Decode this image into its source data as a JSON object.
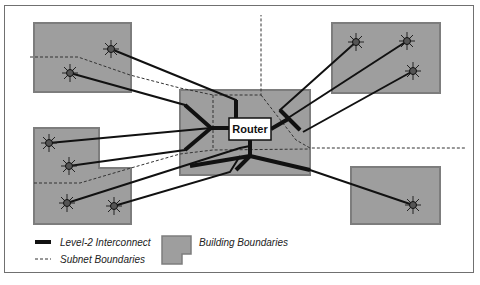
{
  "diagram": {
    "router_label": "Router",
    "colors": {
      "building_fill": "#9e9e9e",
      "building_stroke": "#7d7d7d",
      "interconnect": "#111111",
      "subnet": "#333333",
      "node_fill": "#555555"
    },
    "buildings": [
      {
        "id": "building-top-left",
        "shape": "rect"
      },
      {
        "id": "building-left-l",
        "shape": "l-shape"
      },
      {
        "id": "building-center",
        "shape": "rect",
        "contains": "Router"
      },
      {
        "id": "building-top-right",
        "shape": "rect"
      },
      {
        "id": "building-bottom-right",
        "shape": "rect"
      }
    ],
    "nodes": [
      {
        "building": "building-top-left",
        "x": 111,
        "y": 49
      },
      {
        "building": "building-top-left",
        "x": 70,
        "y": 73
      },
      {
        "building": "building-left-l",
        "x": 49,
        "y": 143
      },
      {
        "building": "building-left-l",
        "x": 69,
        "y": 166
      },
      {
        "building": "building-left-l",
        "x": 67,
        "y": 203
      },
      {
        "building": "building-left-l",
        "x": 114,
        "y": 206
      },
      {
        "building": "building-top-right",
        "x": 356,
        "y": 42
      },
      {
        "building": "building-top-right",
        "x": 407,
        "y": 41
      },
      {
        "building": "building-top-right",
        "x": 413,
        "y": 71
      },
      {
        "building": "building-bottom-right",
        "x": 413,
        "y": 205
      }
    ]
  },
  "legend": {
    "interconnect_label": "Level-2 Interconnect",
    "subnet_label": "Subnet Boundaries",
    "building_label": "Building Boundaries"
  }
}
